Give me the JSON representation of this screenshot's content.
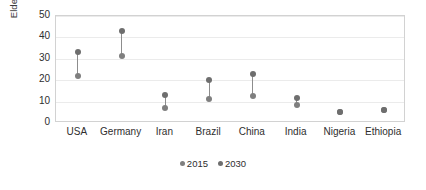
{
  "chart_data": {
    "type": "scatter",
    "title": "",
    "xlabel": "",
    "ylabel": "Elderly support ratio",
    "categories": [
      "USA",
      "Germany",
      "Iran",
      "Brazil",
      "China",
      "India",
      "Nigeria",
      "Ethiopia"
    ],
    "series": [
      {
        "name": "2015",
        "values": [
          22,
          31.5,
          7,
          11,
          12.5,
          8.5,
          5,
          6
        ]
      },
      {
        "name": "2030",
        "values": [
          33,
          43,
          13,
          20,
          23,
          11.5,
          5,
          6.2
        ]
      }
    ],
    "ylim": [
      0,
      50
    ],
    "yticks": [
      0,
      10,
      20,
      30,
      40,
      50
    ],
    "grid": true,
    "legend_position": "bottom",
    "legend": [
      "2015",
      "2030"
    ],
    "marker_color_2015": "#7f7f7f",
    "marker_color_2030": "#6e6e6e",
    "connector_color": "#8d8d8d",
    "grid_color": "#ebebeb",
    "plot_border_color": "#d2d2d2"
  }
}
